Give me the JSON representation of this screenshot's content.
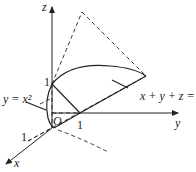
{
  "diagram": {
    "type": "3d-coordinate-region",
    "axes": {
      "x": {
        "label": "x",
        "tick": "1"
      },
      "y": {
        "label": "y",
        "tick": "1"
      },
      "z": {
        "label": "z",
        "tick": "1"
      }
    },
    "origin_label": "O",
    "surfaces": {
      "parabolic_cylinder": "y = x²",
      "plane": "x + y + z = 1"
    },
    "colors": {
      "stroke": "#222222",
      "background": "#ffffff"
    }
  }
}
